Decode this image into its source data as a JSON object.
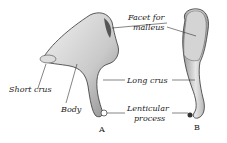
{
  "figure": {
    "views": [
      {
        "id": "A",
        "label": "A"
      },
      {
        "id": "B",
        "label": "B"
      }
    ],
    "labels": {
      "facet_line1": "Facet for",
      "facet_line2": "malleus",
      "short_crus": "Short crus",
      "body": "Body",
      "long_crus": "Long crus",
      "lenticular_line1": "Lenticular",
      "lenticular_line2": "process"
    }
  }
}
